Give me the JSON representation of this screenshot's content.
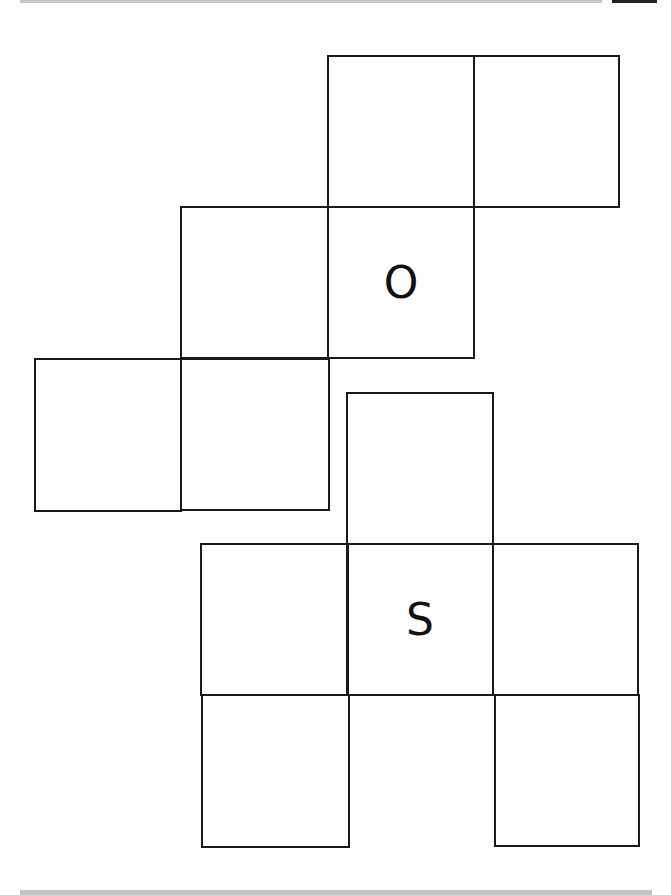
{
  "diagram": {
    "nets": [
      {
        "name": "net-1",
        "cells": [
          {
            "id": "n1-c1",
            "x": 327,
            "y": 55,
            "w": 148,
            "h": 153,
            "label": ""
          },
          {
            "id": "n1-c2",
            "x": 473,
            "y": 55,
            "w": 147,
            "h": 153,
            "label": ""
          },
          {
            "id": "n1-c3",
            "x": 180,
            "y": 206,
            "w": 149,
            "h": 153,
            "label": ""
          },
          {
            "id": "n1-c4",
            "x": 327,
            "y": 206,
            "w": 148,
            "h": 153,
            "label": "O"
          },
          {
            "id": "n1-c5",
            "x": 34,
            "y": 358,
            "w": 148,
            "h": 154,
            "label": ""
          },
          {
            "id": "n1-c6",
            "x": 180,
            "y": 358,
            "w": 150,
            "h": 153,
            "label": ""
          }
        ]
      },
      {
        "name": "net-2",
        "cells": [
          {
            "id": "n2-c1",
            "x": 346,
            "y": 392,
            "w": 148,
            "h": 153,
            "label": ""
          },
          {
            "id": "n2-c2",
            "x": 200,
            "y": 543,
            "w": 149,
            "h": 153,
            "label": ""
          },
          {
            "id": "n2-c3",
            "x": 346,
            "y": 543,
            "w": 148,
            "h": 153,
            "label": "S"
          },
          {
            "id": "n2-c4",
            "x": 492,
            "y": 543,
            "w": 147,
            "h": 153,
            "label": ""
          },
          {
            "id": "n2-c5",
            "x": 201,
            "y": 694,
            "w": 149,
            "h": 154,
            "label": ""
          },
          {
            "id": "n2-c6",
            "x": 494,
            "y": 694,
            "w": 146,
            "h": 153,
            "label": ""
          }
        ]
      }
    ],
    "labels": {
      "top_face": "O",
      "bottom_face": "S"
    }
  }
}
